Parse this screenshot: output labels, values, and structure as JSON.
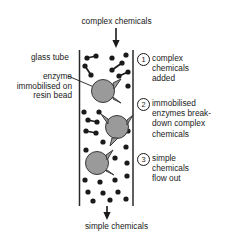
{
  "diagram": {
    "title_top": "complex chemicals",
    "title_bottom": "simple chemicals",
    "labels": {
      "glass_tube": "glass tube",
      "enzyme_bead": "enzyme immobilised on resin bead"
    },
    "steps": [
      {
        "number": "1",
        "text": "complex\nchemicals\nadded"
      },
      {
        "number": "2",
        "text": "immobilised\nenzymes break-\ndown complex\nchemicals"
      },
      {
        "number": "3",
        "text": "simple\nchemicals\nflow out"
      }
    ],
    "colors": {
      "ink": "#1a1a1a",
      "bead_fill": "#9a9a9a",
      "bead_stroke": "#3a3a3a",
      "tube_wall": "#2a2a2a",
      "background": "#ffffff"
    },
    "icons": {
      "arrow_in": "down-arrow-icon",
      "arrow_out": "down-arrow-icon",
      "complex_molecule": "dumbbell-molecule-icon",
      "simple_molecule": "dot-molecule-icon",
      "resin_bead": "resin-bead-icon"
    }
  }
}
